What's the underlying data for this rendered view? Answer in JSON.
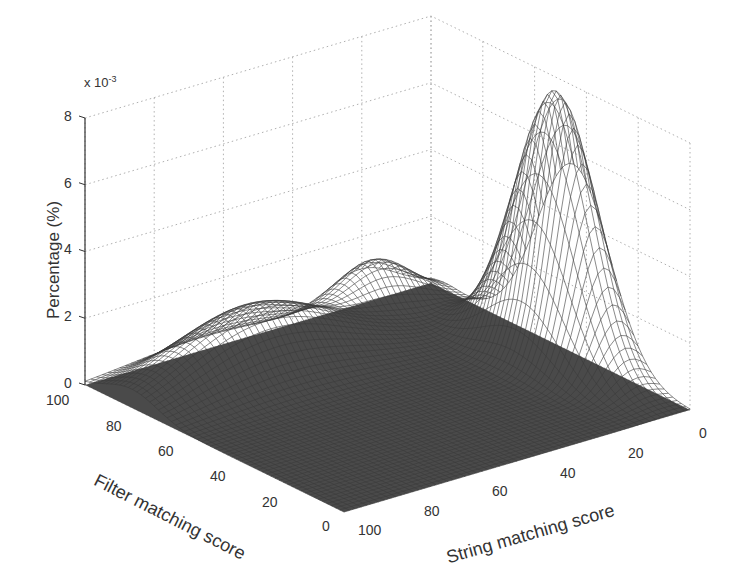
{
  "chart_data": {
    "type": "surface3d",
    "title": "",
    "xlabel": "String matching score",
    "ylabel": "Filter matching score",
    "zlabel": "Percentage (%)",
    "z_multiplier": "x 10^-3",
    "z_multiplier_base": "x 10",
    "z_multiplier_exp": "-3",
    "x_ticks": [
      "0",
      "20",
      "40",
      "60",
      "80",
      "100"
    ],
    "y_ticks": [
      "0",
      "20",
      "40",
      "60",
      "80",
      "100"
    ],
    "z_ticks": [
      "0",
      "2",
      "4",
      "6",
      "8"
    ],
    "xlim": [
      0,
      100
    ],
    "ylim": [
      0,
      100
    ],
    "zlim": [
      0,
      8
    ],
    "grid": true,
    "colors": {
      "mesh": "#3a3a3a",
      "grid": "#b0b0b0",
      "axis": "#333333"
    },
    "surface_features": [
      {
        "name": "main-peak",
        "string_score": 5,
        "filter_score": 45,
        "height": 8.0,
        "sigma_string": 6,
        "sigma_filter": 14
      },
      {
        "name": "ridge",
        "string_score": 65,
        "filter_score": 82,
        "height": 2.0,
        "sigma_string": 22,
        "sigma_filter": 10
      },
      {
        "name": "back-plateau",
        "string_score": 20,
        "filter_score": 95,
        "height": 1.4,
        "sigma_string": 10,
        "sigma_filter": 6
      }
    ]
  }
}
